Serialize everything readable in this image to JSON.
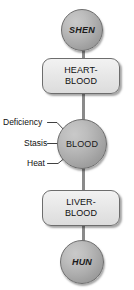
{
  "diagram": {
    "orientation": "vertical",
    "colors": {
      "circle_fill": "#ababab",
      "box_fill": "#e8e8e8",
      "outline": "#6d6d6d",
      "connector": "#8a8a8a",
      "text": "#101010",
      "background": "#ffffff"
    },
    "nodes": [
      {
        "id": "shen",
        "shape": "circle",
        "label": "SHEN",
        "style": "italic-bold"
      },
      {
        "id": "heart-blood",
        "shape": "rounded-rect",
        "label": "HEART-\nBLOOD",
        "style": "plain"
      },
      {
        "id": "blood",
        "shape": "circle",
        "label": "BLOOD",
        "style": "plain"
      },
      {
        "id": "liver-blood",
        "shape": "rounded-rect",
        "label": "LIVER-\nBLOOD",
        "style": "plain"
      },
      {
        "id": "hun",
        "shape": "circle",
        "label": "HUN",
        "style": "italic-bold"
      }
    ],
    "connectors": [
      {
        "from": "shen",
        "to": "heart-blood"
      },
      {
        "from": "heart-blood",
        "to": "blood"
      },
      {
        "from": "blood",
        "to": "liver-blood"
      },
      {
        "from": "liver-blood",
        "to": "hun"
      }
    ],
    "callouts": [
      {
        "id": "deficiency",
        "label": "Deficiency",
        "target": "blood"
      },
      {
        "id": "stasis",
        "label": "Stasis",
        "target": "blood"
      },
      {
        "id": "heat",
        "label": "Heat",
        "target": "blood"
      }
    ]
  }
}
